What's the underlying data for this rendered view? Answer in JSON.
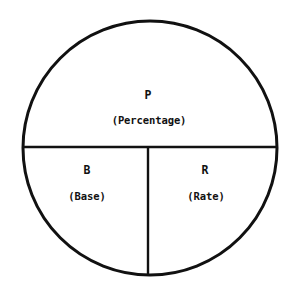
{
  "diagram": {
    "kind": "percentage-circle-diagram",
    "background_color": "#ffffff",
    "stroke_color": "#111111",
    "text_color": "#111111",
    "circle": {
      "center_x": 150,
      "center_y": 148,
      "radius": 127,
      "stroke_width": 3
    },
    "dividers": {
      "horizontal": {
        "y": 147,
        "x_start": 24,
        "x_end": 277,
        "stroke_width": 2.4
      },
      "vertical": {
        "x": 148,
        "y_start": 147,
        "y_end": 276,
        "stroke_width": 2.4
      }
    },
    "regions": [
      {
        "id": "percentage",
        "symbol": "P",
        "word": "(Percentage)",
        "position": "top-half"
      },
      {
        "id": "base",
        "symbol": "B",
        "word": "(Base)",
        "position": "bottom-left-quarter"
      },
      {
        "id": "rate",
        "symbol": "R",
        "word": "(Rate)",
        "position": "bottom-right-quarter"
      }
    ]
  }
}
